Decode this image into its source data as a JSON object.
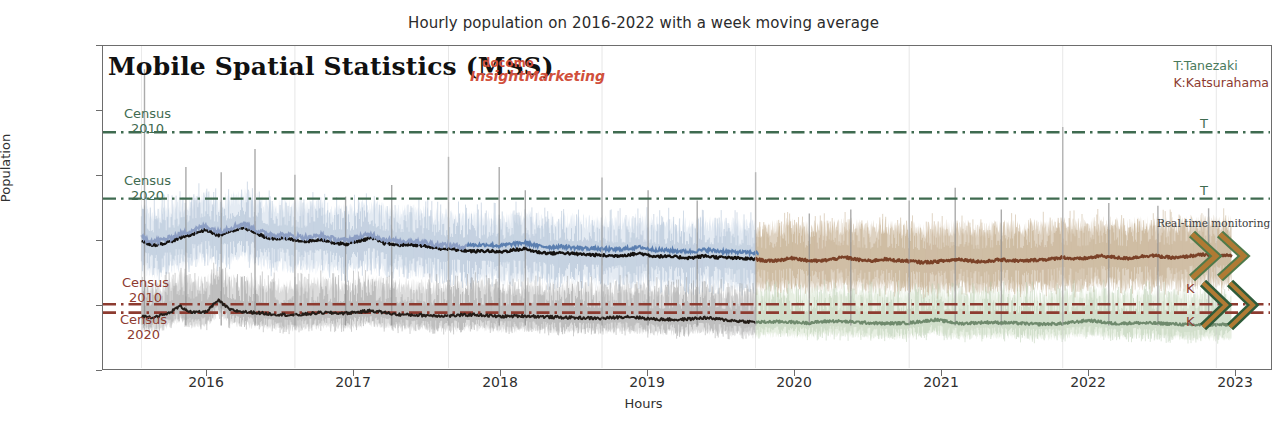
{
  "figure": {
    "title": "Hourly population on 2016-2022 with a week moving average",
    "inner_title": "Mobile Spatial Statistics (MSS)",
    "brand_line1": "docomo",
    "brand_line2": "InsightMarketing",
    "realtime_note": "Real-time monitoring"
  },
  "legend": {
    "tanezaki": "T:Tanezaki",
    "katsurahama": "K:Katsurahama"
  },
  "annotations": {
    "census_t2010_l1": "Census",
    "census_t2010_l2": "2010",
    "census_t2020_l1": "Census",
    "census_t2020_l2": "2020",
    "census_k2010_l1": "Census",
    "census_k2010_l2": "2010",
    "census_k2020_l1": "Census",
    "census_k2020_l2": "2020",
    "end_t_upper": "T",
    "end_t_lower": "T",
    "end_k_upper": "K",
    "end_k_lower": "K"
  },
  "colors": {
    "tanezaki_green": "#3f6b50",
    "katsurahama_red": "#8d3b30",
    "brand_red": "#d1503c",
    "axis": "#6d6d6d",
    "mean_dark": "#14110f",
    "blue_line": "#5b7fb0",
    "blue_band": "#cddaea",
    "gray_band": "#b9b9b9",
    "tan_band": "#c3ad8e",
    "brown_line": "#7a4127",
    "green_band": "#cfe0c6",
    "green_line": "#6f8a6d"
  },
  "chart_data": {
    "type": "line",
    "title": "Hourly population on 2016-2022 with a week moving average",
    "xlabel": "Hours",
    "ylabel": "Population",
    "xlim": [
      2015.75,
      2023.35
    ],
    "ylim": [
      0,
      2500
    ],
    "xticks": [
      "2016",
      "2017",
      "2018",
      "2019",
      "2020",
      "2021",
      "2022",
      "2023"
    ],
    "yticks": [
      0,
      500,
      1000,
      1500,
      2000,
      2500
    ],
    "grid": false,
    "legend_position": "top-right",
    "reference_lines": [
      {
        "name": "Tanezaki Census 2010",
        "value": 1830,
        "color": "#3f6b50",
        "style": "dashdot",
        "label_left": "Census 2010",
        "label_right": "T"
      },
      {
        "name": "Tanezaki Census 2020",
        "value": 1315,
        "color": "#3f6b50",
        "style": "dashdot",
        "label_left": "Census 2020",
        "label_right": "T"
      },
      {
        "name": "Katsurahama Census 2010",
        "value": 495,
        "color": "#8d3b30",
        "style": "dashdot",
        "label_left": "Census 2010",
        "label_right": "K"
      },
      {
        "name": "Katsurahama Census 2020",
        "value": 430,
        "color": "#8d3b30",
        "style": "dashdot",
        "label_left": "Census 2020",
        "label_right": "K"
      }
    ],
    "series": [
      {
        "name": "Tanezaki weekly moving average",
        "color": "#14110f",
        "x": [
          2016.0,
          2016.08,
          2016.17,
          2016.25,
          2016.33,
          2016.42,
          2016.5,
          2016.58,
          2016.67,
          2016.75,
          2016.83,
          2016.92,
          2017.0,
          2017.08,
          2017.17,
          2017.25,
          2017.33,
          2017.42,
          2017.5,
          2017.58,
          2017.67,
          2017.75,
          2017.83,
          2017.92,
          2018.0,
          2018.08,
          2018.17,
          2018.25,
          2018.33,
          2018.42,
          2018.5,
          2018.58,
          2018.67,
          2018.75,
          2018.83,
          2018.92,
          2019.0,
          2019.08,
          2019.17,
          2019.25,
          2019.33,
          2019.42,
          2019.5,
          2019.58,
          2019.67,
          2019.75,
          2019.83,
          2019.92,
          2020.0,
          2020.08,
          2020.17,
          2020.25,
          2020.33,
          2020.42,
          2020.5,
          2020.58,
          2020.67,
          2020.75,
          2020.83,
          2020.92,
          2021.0,
          2021.08,
          2021.17,
          2021.25,
          2021.33,
          2021.42,
          2021.5,
          2021.58,
          2021.67,
          2021.75,
          2021.83,
          2021.92,
          2022.0,
          2022.08,
          2022.17,
          2022.25,
          2022.33,
          2022.42,
          2022.5,
          2022.58,
          2022.67,
          2022.75,
          2022.83,
          2022.92,
          2023.0,
          2023.1
        ],
        "y": [
          985,
          955,
          975,
          1010,
          1040,
          1075,
          1030,
          1060,
          1095,
          1040,
          1010,
          1005,
          995,
          985,
          1000,
          975,
          960,
          990,
          1010,
          970,
          955,
          960,
          950,
          930,
          925,
          915,
          905,
          910,
          900,
          915,
          925,
          900,
          890,
          895,
          885,
          880,
          875,
          870,
          880,
          890,
          870,
          865,
          860,
          855,
          870,
          860,
          855,
          850,
          845,
          830,
          840,
          855,
          835,
          830,
          845,
          860,
          840,
          830,
          845,
          835,
          830,
          820,
          825,
          835,
          845,
          830,
          825,
          840,
          835,
          830,
          840,
          845,
          860,
          845,
          855,
          870,
          860,
          850,
          865,
          875,
          860,
          855,
          870,
          880,
          870,
          875
        ]
      },
      {
        "name": "Katsurahama weekly moving average",
        "color": "#4d4238",
        "x": [
          2016.0,
          2016.08,
          2016.17,
          2016.25,
          2016.33,
          2016.42,
          2016.5,
          2016.58,
          2016.67,
          2016.75,
          2016.83,
          2016.92,
          2017.0,
          2017.17,
          2017.33,
          2017.5,
          2017.67,
          2017.83,
          2018.0,
          2018.17,
          2018.33,
          2018.5,
          2018.67,
          2018.83,
          2019.0,
          2019.17,
          2019.33,
          2019.5,
          2019.67,
          2019.83,
          2020.0,
          2020.17,
          2020.33,
          2020.5,
          2020.67,
          2020.83,
          2021.0,
          2021.17,
          2021.33,
          2021.5,
          2021.67,
          2021.83,
          2022.0,
          2022.17,
          2022.33,
          2022.5,
          2022.67,
          2022.83,
          2023.0,
          2023.1
        ],
        "y": [
          400,
          395,
          420,
          480,
          430,
          435,
          525,
          450,
          435,
          430,
          420,
          415,
          410,
          430,
          425,
          445,
          415,
          410,
          405,
          415,
          400,
          405,
          395,
          390,
          385,
          400,
          380,
          375,
          390,
          370,
          355,
          360,
          350,
          365,
          355,
          345,
          350,
          375,
          345,
          355,
          350,
          340,
          345,
          370,
          345,
          350,
          345,
          335,
          335,
          338
        ]
      }
    ],
    "bands": [
      {
        "name": "Tanezaki hourly range 2016-2019",
        "color": "#cddaea",
        "low": 700,
        "high": 1350
      },
      {
        "name": "Tanezaki hourly range 2020-2023",
        "color": "#c3ad8e",
        "low": 700,
        "high": 1250
      },
      {
        "name": "Katsurahama hourly range 2016-2019",
        "color": "#b9b9b9",
        "low": 280,
        "high": 760
      },
      {
        "name": "Katsurahama hourly range 2020-2023",
        "color": "#cfe0c6",
        "low": 260,
        "high": 520
      }
    ],
    "notes": [
      "Sparse vertical spikes reach up to ~2300 (event days)"
    ]
  }
}
